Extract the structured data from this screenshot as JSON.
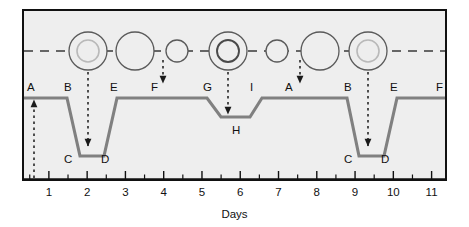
{
  "figure": {
    "type": "eclipsing-binary-light-curve",
    "x_axis_title": "Days",
    "plot_background": "#eeeeee",
    "frame_color": "#111111",
    "curve_color": "#808080",
    "orbit_line_color": "#3a3a3a",
    "star_outline_color": "#5a5a5a"
  },
  "axis": {
    "tick_labels": [
      "1",
      "2",
      "3",
      "4",
      "5",
      "6",
      "7",
      "8",
      "9",
      "10",
      "11"
    ],
    "tick_values": [
      1,
      2,
      3,
      4,
      5,
      6,
      7,
      8,
      9,
      10,
      11
    ],
    "minor_ticks_between": 1
  },
  "curve_labels": [
    {
      "text": "A",
      "x": 30,
      "y": 88
    },
    {
      "text": "B",
      "x": 67,
      "y": 88
    },
    {
      "text": "C",
      "x": 67,
      "y": 160
    },
    {
      "text": "D",
      "x": 104,
      "y": 160
    },
    {
      "text": "E",
      "x": 113,
      "y": 88
    },
    {
      "text": "F",
      "x": 154,
      "y": 88
    },
    {
      "text": "G",
      "x": 206,
      "y": 88
    },
    {
      "text": "H",
      "x": 235,
      "y": 131
    },
    {
      "text": "I",
      "x": 253,
      "y": 88
    },
    {
      "text": "A",
      "x": 288,
      "y": 88
    },
    {
      "text": "B",
      "x": 347,
      "y": 88
    },
    {
      "text": "C",
      "x": 347,
      "y": 160
    },
    {
      "text": "D",
      "x": 384,
      "y": 160
    },
    {
      "text": "E",
      "x": 393,
      "y": 88
    },
    {
      "text": "F",
      "x": 439,
      "y": 88
    }
  ],
  "chart_data": {
    "type": "line",
    "title": "",
    "xlabel": "Days",
    "ylabel": "",
    "xlim": [
      0.35,
      11.35
    ],
    "series": [
      {
        "name": "brightness",
        "comment": "flat maximum with two deep primary eclipses and one shallow secondary eclipse",
        "points": [
          {
            "x": 0.35,
            "y": 1.0
          },
          {
            "x": 1.62,
            "y": 1.0
          },
          {
            "x": 1.95,
            "y": 0.34
          },
          {
            "x": 2.35,
            "y": 0.34
          },
          {
            "x": 2.78,
            "y": 1.0
          },
          {
            "x": 5.15,
            "y": 1.0
          },
          {
            "x": 5.42,
            "y": 0.8
          },
          {
            "x": 5.95,
            "y": 0.8
          },
          {
            "x": 6.15,
            "y": 1.0
          },
          {
            "x": 8.55,
            "y": 1.0
          },
          {
            "x": 8.95,
            "y": 0.34
          },
          {
            "x": 9.35,
            "y": 0.34
          },
          {
            "x": 9.72,
            "y": 1.0
          },
          {
            "x": 11.35,
            "y": 1.0
          }
        ]
      }
    ]
  },
  "orbit_diagram": {
    "line_style": "dashed",
    "stars": [
      {
        "id": "star-pair-1",
        "cx": 88,
        "r_outer": 19,
        "inner": {
          "r": 11,
          "style": "light-gray-outline"
        },
        "state": "primary-eclipse-companion-behind"
      },
      {
        "id": "star-pair-2",
        "cx": 135,
        "r_outer": 19,
        "inner": null,
        "state": "separated"
      },
      {
        "id": "star-pair-3",
        "cx": 177,
        "r_outer": 11,
        "inner": null,
        "state": "small-star"
      },
      {
        "id": "star-pair-4",
        "cx": 228,
        "r_outer": 19,
        "inner": {
          "r": 11,
          "style": "dark-outline"
        },
        "state": "secondary-eclipse-companion-in-front"
      },
      {
        "id": "star-pair-5",
        "cx": 277,
        "r_outer": 11,
        "inner": null,
        "state": "small-star"
      },
      {
        "id": "star-pair-6",
        "cx": 320,
        "r_outer": 19,
        "inner": null,
        "state": "separated"
      },
      {
        "id": "star-pair-7",
        "cx": 368,
        "r_outer": 19,
        "inner": {
          "r": 11,
          "style": "light-gray-outline"
        },
        "state": "primary-eclipse-companion-behind"
      }
    ]
  },
  "arrows": [
    {
      "id": "arrow-A-up",
      "direction": "up",
      "x": 34,
      "from_y": 178,
      "to_y": 98
    },
    {
      "id": "arrow-primary-1-down",
      "direction": "down",
      "x": 88,
      "from_y": 70,
      "to_y": 148
    },
    {
      "id": "arrow-F-down",
      "direction": "down",
      "x": 163,
      "from_y": 62,
      "to_y": 84
    },
    {
      "id": "arrow-secondary-down",
      "direction": "down",
      "x": 228,
      "from_y": 70,
      "to_y": 116
    },
    {
      "id": "arrow-A2-down",
      "direction": "down",
      "x": 300,
      "from_y": 62,
      "to_y": 84
    },
    {
      "id": "arrow-primary-2-down",
      "direction": "down",
      "x": 368,
      "from_y": 70,
      "to_y": 148
    }
  ]
}
